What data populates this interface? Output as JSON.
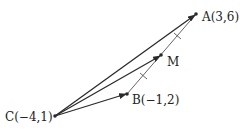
{
  "diagram": {
    "colors": {
      "line": "#2a2a2a",
      "thin_line": "#555555",
      "text": "#222222",
      "background": "#ffffff"
    },
    "points": {
      "A": {
        "name": "A",
        "label": "A(3,6)",
        "coords": [
          3,
          6
        ],
        "px": [
          196,
          14
        ]
      },
      "M": {
        "name": "M",
        "label": "M",
        "px": [
          161,
          55
        ]
      },
      "B": {
        "name": "B",
        "label": "B(−1,2)",
        "coords": [
          -1,
          2
        ],
        "px": [
          127,
          94
        ]
      },
      "C": {
        "name": "C",
        "label": "C(−4,1)",
        "coords": [
          -4,
          1
        ],
        "px": [
          55,
          116
        ]
      }
    },
    "vectors": [
      {
        "from": "C",
        "to": "A",
        "arrow": true
      },
      {
        "from": "C",
        "to": "M",
        "arrow": true
      },
      {
        "from": "C",
        "to": "B",
        "arrow": true
      }
    ],
    "segments": [
      {
        "from": "B",
        "to": "A",
        "tick_marks": 2,
        "note": "equal-length marks on BM and MA"
      }
    ]
  }
}
